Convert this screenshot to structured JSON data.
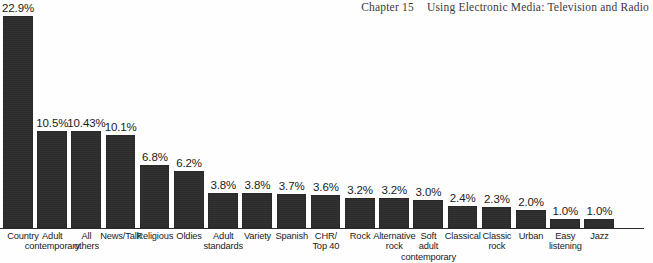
{
  "running_head": {
    "chapter": "Chapter 15",
    "title": "Using Electronic Media: Television and Radio"
  },
  "colors": {
    "bar": "#2b2b2b",
    "background": "#ffffff",
    "text": "#1b1b1b",
    "axis": "#2b2b2b"
  },
  "chart_data": {
    "type": "bar",
    "title": "",
    "subtitle": "",
    "xlabel": "",
    "ylabel": "",
    "ylim": [
      0,
      22.9
    ],
    "grid": false,
    "legend": "none",
    "value_suffix": "%",
    "categories": [
      "Country",
      "Adult contemporary",
      "All others",
      "News/Talk",
      "Religious",
      "Oldies",
      "Adult standards",
      "Variety",
      "Spanish",
      "CHR/ Top 40",
      "Rock",
      "Alternative rock",
      "Soft adult contemporary",
      "Classical",
      "Classic rock",
      "Urban",
      "Easy listening",
      "Jazz"
    ],
    "category_lines": [
      [
        "Country"
      ],
      [
        "Adult",
        "contemporary"
      ],
      [
        "All",
        "others"
      ],
      [
        "News/Talk"
      ],
      [
        "Religious"
      ],
      [
        "Oldies"
      ],
      [
        "Adult",
        "standards"
      ],
      [
        "Variety"
      ],
      [
        "Spanish"
      ],
      [
        "CHR/",
        "Top 40"
      ],
      [
        "Rock"
      ],
      [
        "Alternative",
        "rock"
      ],
      [
        "Soft",
        "adult",
        "contemporary"
      ],
      [
        "Classical"
      ],
      [
        "Classic",
        "rock"
      ],
      [
        "Urban"
      ],
      [
        "Easy",
        "listening"
      ],
      [
        "Jazz"
      ]
    ],
    "values": [
      22.9,
      10.5,
      10.43,
      10.1,
      6.8,
      6.2,
      3.8,
      3.8,
      3.7,
      3.6,
      3.2,
      3.2,
      3.0,
      2.4,
      2.3,
      2.0,
      1.0,
      1.0
    ],
    "value_labels": [
      "22.9%",
      "10.5%",
      "10.43%",
      "10.1%",
      "6.8%",
      "6.2%",
      "3.8%",
      "3.8%",
      "3.7%",
      "3.6%",
      "3.2%",
      "3.2%",
      "3.0%",
      "2.4%",
      "2.3%",
      "2.0%",
      "1.0%",
      "1.0%"
    ]
  }
}
